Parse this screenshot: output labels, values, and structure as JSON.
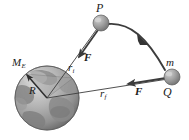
{
  "figure": {
    "background_color": "#ffffff",
    "width": 189,
    "height": 140
  },
  "labels": {
    "point_p": "P",
    "point_q": "Q",
    "earth_mass": "M",
    "earth_mass_subscript": "E",
    "earth_radius": "R",
    "force_upper": "F",
    "force_lower": "F",
    "r_initial": "r",
    "r_initial_subscript": "i",
    "r_final": "r",
    "r_final_subscript": "f",
    "small_mass": "m"
  },
  "colors": {
    "ink": "#1a1a1a",
    "line": "#3c3c3c",
    "earth_ocean": "#b9b9b9",
    "earth_land": "#8e8e8e",
    "earth_shadow": "#6d6d6d",
    "earth_highlight": "#d8d8d8",
    "sphere_body": "#9a9a9a",
    "sphere_highlight": "#c9c9c9",
    "cone_fill": "#9d9d9d"
  },
  "geometry": {
    "earth_center": [
      47,
      98
    ],
    "earth_radius_px": 32,
    "point_p": [
      101,
      23
    ],
    "point_q": [
      172,
      77
    ],
    "trajectory": "curved arc from P over the top to Q",
    "r_initial_line": "from Earth center to P",
    "r_final_line": "from Earth center to Q",
    "force_upper_direction": "from P toward Earth center",
    "force_lower_direction": "from Q toward Earth center"
  }
}
